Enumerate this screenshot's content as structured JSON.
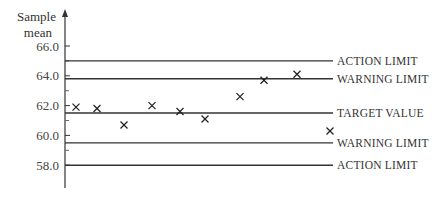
{
  "chart_data": {
    "type": "scatter",
    "title": "",
    "ylabel": "Sample mean",
    "xlabel": "",
    "ylim": [
      56.5,
      67.5
    ],
    "yticks": [
      58.0,
      60.0,
      62.0,
      64.0,
      66.0
    ],
    "ytick_labels": [
      "58.0",
      "60.0",
      "62.0",
      "64.0",
      "66.0"
    ],
    "minor_yticks": [
      59.0,
      61.0,
      63.0,
      65.0
    ],
    "grid": false,
    "marker": "x",
    "series": [
      {
        "name": "Sample means",
        "x": [
          1,
          2,
          3,
          4,
          5,
          6,
          7,
          8,
          9,
          10
        ],
        "values": [
          61.9,
          61.8,
          60.7,
          62.0,
          61.6,
          61.1,
          62.6,
          63.7,
          64.1,
          60.3
        ]
      }
    ],
    "reference_lines": [
      {
        "label": "ACTION LIMIT",
        "value": 65.0
      },
      {
        "label": "WARNING LIMIT",
        "value": 63.8
      },
      {
        "label": "TARGET VALUE",
        "value": 61.5
      },
      {
        "label": "WARNING LIMIT",
        "value": 59.5
      },
      {
        "label": "ACTION LIMIT",
        "value": 58.0
      }
    ]
  },
  "axis": {
    "ylabel_line1": "Sample",
    "ylabel_line2": "mean"
  },
  "colors": {
    "line": "#333333",
    "marker": "#222222",
    "text": "#333333"
  }
}
